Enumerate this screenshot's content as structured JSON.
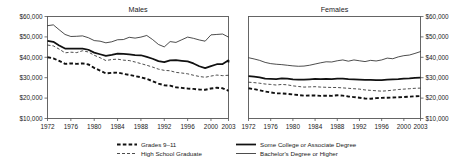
{
  "figure": {
    "width": 469,
    "height": 166,
    "background": "#ffffff",
    "ink_color": "#111111",
    "frame_color": "#555555"
  },
  "chart_data": {
    "type": "line",
    "title": "",
    "xlabel": "",
    "ylabel": "",
    "grid": false,
    "legend_position": "bottom",
    "ylim": [
      10000,
      60000
    ],
    "xlim": [
      1972,
      2003
    ],
    "ytick_labels": [
      "$60,000",
      "$50,000",
      "$40,000",
      "$30,000",
      "$20,000",
      "$10,000"
    ],
    "ytick_values": [
      60000,
      50000,
      40000,
      30000,
      20000,
      10000
    ],
    "xtick_labels": [
      "1972",
      "1976",
      "1980",
      "1984",
      "1988",
      "1992",
      "1996",
      "2000",
      "2003"
    ],
    "xtick_values": [
      1972,
      1976,
      1980,
      1984,
      1988,
      1992,
      1996,
      2000,
      2003
    ],
    "x": [
      1972,
      1973,
      1974,
      1975,
      1976,
      1977,
      1978,
      1979,
      1980,
      1981,
      1982,
      1983,
      1984,
      1985,
      1986,
      1987,
      1988,
      1989,
      1990,
      1991,
      1992,
      1993,
      1994,
      1995,
      1996,
      1997,
      1998,
      1999,
      2000,
      2001,
      2002,
      2003
    ],
    "panels": [
      {
        "name": "males",
        "title": "Males",
        "yaxis_side": "left",
        "series": [
          {
            "name": "Bachelor's Degree or Higher",
            "style": "thin-solid",
            "values": [
              55500,
              55900,
              53500,
              51200,
              50200,
              50300,
              50500,
              49600,
              48200,
              47900,
              47100,
              47600,
              48600,
              48700,
              49800,
              49400,
              49900,
              50700,
              48700,
              46300,
              45100,
              47700,
              47300,
              48600,
              49900,
              49300,
              48500,
              47900,
              51000,
              51200,
              51400,
              49900
            ]
          },
          {
            "name": "Some College or Associate Degree",
            "style": "thick-solid",
            "values": [
              48000,
              47600,
              45800,
              44300,
              44300,
              44200,
              44300,
              43700,
              42300,
              41500,
              40700,
              41200,
              41800,
              41700,
              41400,
              41100,
              41000,
              40200,
              39300,
              38100,
              37600,
              38500,
              38600,
              38300,
              38000,
              37000,
              35600,
              34700,
              35700,
              36600,
              36700,
              38500,
              37500
            ]
          },
          {
            "name": "High School Graduate",
            "style": "thin-dashed",
            "values": [
              46000,
              45600,
              44000,
              42200,
              42500,
              42300,
              43200,
              42600,
              41000,
              39800,
              38400,
              38900,
              39100,
              38600,
              38400,
              37700,
              36900,
              36100,
              35200,
              34200,
              33600,
              33400,
              32600,
              32300,
              31900,
              31200,
              30600,
              30200,
              30800,
              31300,
              31000,
              31200
            ]
          },
          {
            "name": "Grades 9–11",
            "style": "thick-dashed",
            "values": [
              40000,
              39500,
              38200,
              36800,
              37000,
              36800,
              37000,
              36500,
              34800,
              33500,
              32100,
              32400,
              32500,
              31900,
              31400,
              30800,
              30200,
              29400,
              28300,
              27100,
              26300,
              26100,
              25300,
              25000,
              24700,
              24500,
              24200,
              24100,
              24700,
              25100,
              24800,
              23600
            ]
          }
        ]
      },
      {
        "name": "females",
        "title": "Females",
        "yaxis_side": "right",
        "series": [
          {
            "name": "Bachelor's Degree or Higher",
            "style": "thin-solid",
            "values": [
              39800,
              39200,
              38500,
              37500,
              36900,
              36600,
              36400,
              36100,
              35800,
              35600,
              35700,
              36100,
              36700,
              37300,
              37800,
              37700,
              38300,
              38700,
              38100,
              38700,
              38300,
              37900,
              38500,
              38200,
              38700,
              39600,
              39300,
              40200,
              40800,
              41100,
              41900,
              42800
            ]
          },
          {
            "name": "Some College or Associate Degree",
            "style": "thick-solid",
            "values": [
              30800,
              30500,
              30200,
              29500,
              29400,
              29300,
              29700,
              29600,
              29200,
              29000,
              29000,
              29200,
              29400,
              29300,
              29400,
              29300,
              29600,
              29500,
              29300,
              29200,
              29100,
              28900,
              28900,
              28800,
              28800,
              29000,
              29200,
              29300,
              29600,
              29700,
              29900,
              30000
            ]
          },
          {
            "name": "High School Graduate",
            "style": "thin-dashed",
            "values": [
              27800,
              27600,
              27300,
              26900,
              26700,
              26400,
              26700,
              26500,
              26000,
              25700,
              25400,
              25500,
              25600,
              25400,
              25300,
              25200,
              25200,
              25000,
              24800,
              24600,
              24400,
              24000,
              23800,
              23600,
              23400,
              23600,
              23900,
              24200,
              24400,
              24600,
              24800,
              24900
            ]
          },
          {
            "name": "Grades 9–11",
            "style": "thick-dashed",
            "values": [
              24800,
              24400,
              23800,
              23200,
              22800,
              22300,
              22300,
              22100,
              21800,
              21500,
              21200,
              21300,
              21300,
              21100,
              21200,
              21100,
              21400,
              21200,
              20800,
              20500,
              20200,
              19800,
              19700,
              20000,
              20100,
              20200,
              20300,
              20400,
              20500,
              20700,
              20900,
              21000
            ]
          }
        ]
      }
    ],
    "legend": [
      {
        "label": "Grades 9–11",
        "style": "thick-dashed"
      },
      {
        "label": "Some College or Associate Degree",
        "style": "thick-solid"
      },
      {
        "label": "High School Graduate",
        "style": "thin-dashed"
      },
      {
        "label": "Bachelor's Degree or Higher",
        "style": "thin-solid"
      }
    ]
  }
}
